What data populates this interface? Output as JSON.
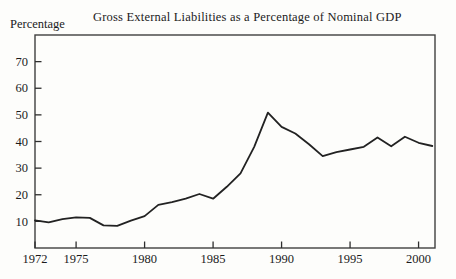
{
  "chart_data": {
    "type": "line",
    "title": "Gross External Liabilities as a Percentage of Nominal GDP",
    "ylabel": "Percentage",
    "xlabel": "",
    "series_name": "Gross external liabilities as % of nominal GDP",
    "x": [
      1972,
      1973,
      1974,
      1975,
      1976,
      1977,
      1978,
      1979,
      1980,
      1981,
      1982,
      1983,
      1984,
      1985,
      1986,
      1987,
      1988,
      1989,
      1990,
      1991,
      1992,
      1993,
      1994,
      1995,
      1996,
      1997,
      1998,
      1999,
      2000,
      2001
    ],
    "values": [
      10.4,
      9.6,
      10.8,
      11.5,
      11.3,
      8.5,
      8.3,
      10.3,
      12.0,
      16.2,
      17.2,
      18.5,
      20.3,
      18.5,
      23.0,
      28.0,
      38.0,
      50.8,
      45.5,
      43.0,
      39.0,
      34.5,
      36.0,
      37.0,
      38.0,
      41.5,
      38.2,
      41.8,
      39.5,
      38.3
    ],
    "xticks": [
      1972,
      1975,
      1980,
      1985,
      1990,
      1995,
      2000
    ],
    "xtick_labels": [
      "1972",
      "1975",
      "1980",
      "1985",
      "1990",
      "1995",
      "2000"
    ],
    "yticks": [
      10,
      20,
      30,
      40,
      50,
      60,
      70
    ],
    "ytick_labels": [
      "10",
      "20",
      "30",
      "40",
      "50",
      "60",
      "70"
    ],
    "xlim": [
      1972,
      2001.2
    ],
    "ylim": [
      0,
      80
    ],
    "grid": false,
    "legend": "none",
    "line_color": "#222222",
    "frame_color": "#3f3f3f",
    "tick_color": "#2e2e2e",
    "background": "#fdfdfb"
  }
}
